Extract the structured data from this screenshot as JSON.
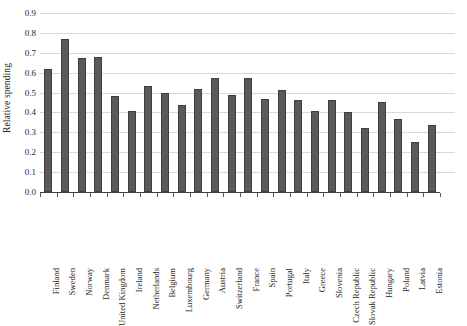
{
  "chart_data": {
    "type": "bar",
    "title": "",
    "subtitle": "",
    "xlabel": "",
    "ylabel": "Relative spending",
    "ylim": [
      0.0,
      0.9
    ],
    "ytick_labels": [
      "0.9",
      "0.8",
      "0.7",
      "0.6",
      "0.5",
      "0.4",
      "0.3",
      "0.2",
      "0.1",
      "0.0"
    ],
    "ytick_values": [
      0.9,
      0.8,
      0.7,
      0.6,
      0.5,
      0.4,
      0.3,
      0.2,
      0.1,
      0.0
    ],
    "grid": true,
    "legend": false,
    "legend_position": "none",
    "bar_color": "#5a5a5a",
    "bar_edge_color": "#3f3f3f",
    "gridline_color": "#d9d9d9",
    "axis_color": "#404040",
    "categories": [
      "Finland",
      "Sweden",
      "Norway",
      "Denmark",
      "United Kingdom",
      "Ireland",
      "Netherlands",
      "Belgium",
      "Luxembourg",
      "Germany",
      "Austria",
      "Switzerland",
      "France",
      "Spain",
      "Portugal",
      "Italy",
      "Greece",
      "Slovenia",
      "Czech Republic",
      "Slovak Republic",
      "Hungary",
      "Poland",
      "Latvia",
      "Estonia"
    ],
    "values": [
      0.62,
      0.77,
      0.675,
      0.68,
      0.485,
      0.405,
      0.535,
      0.5,
      0.435,
      0.52,
      0.575,
      0.49,
      0.575,
      0.47,
      0.515,
      0.465,
      0.405,
      0.465,
      0.4,
      0.32,
      0.455,
      0.365,
      0.25,
      0.335
    ]
  }
}
